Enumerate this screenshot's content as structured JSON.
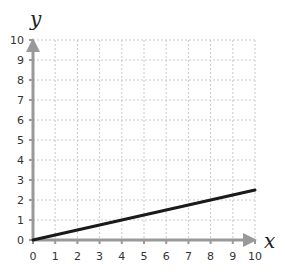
{
  "chart_data": {
    "type": "line",
    "title": "",
    "xlabel": "x",
    "ylabel": "y",
    "xlim": [
      0,
      10
    ],
    "ylim": [
      0,
      10
    ],
    "grid": true,
    "x_ticks": [
      0,
      1,
      2,
      3,
      4,
      5,
      6,
      7,
      8,
      9,
      10
    ],
    "y_ticks": [
      0,
      1,
      2,
      3,
      4,
      5,
      6,
      7,
      8,
      9,
      10
    ],
    "series": [
      {
        "name": "y = x/4",
        "x": [
          0,
          10
        ],
        "y": [
          0,
          2.5
        ],
        "color": "#1a1a1a"
      }
    ],
    "colors": {
      "axis": "#999999",
      "grid": "#c8c8c8",
      "line": "#1a1a1a"
    }
  }
}
